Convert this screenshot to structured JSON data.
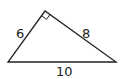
{
  "diagram": {
    "type": "right-triangle",
    "labels": {
      "left_side": "6",
      "right_side": "8",
      "base": "10"
    },
    "right_angle_at": "top vertex",
    "stroke_color": "#222222"
  }
}
